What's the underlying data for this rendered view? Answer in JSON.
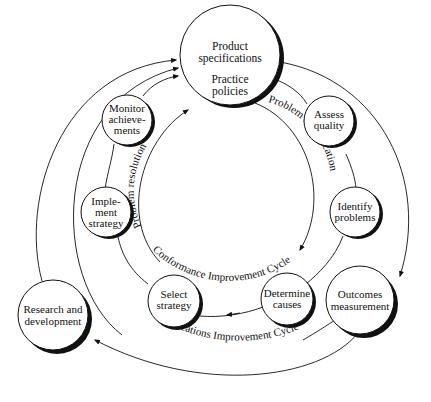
{
  "diagram": {
    "type": "cycle-diagram",
    "center_node": {
      "line1": "Product",
      "line2": "specifications",
      "line3": "Practice",
      "line4": "policies"
    },
    "nodes": {
      "monitor": {
        "line1": "Monitor",
        "line2": "achieve-",
        "line3": "ments"
      },
      "assess": {
        "line1": "Assess",
        "line2": "quality"
      },
      "implement": {
        "line1": "Imple-",
        "line2": "ment",
        "line3": "strategy"
      },
      "identify": {
        "line1": "Identify",
        "line2": "problems"
      },
      "select": {
        "line1": "Select",
        "line2": "strategy"
      },
      "determine": {
        "line1": "Determine",
        "line2": "causes"
      },
      "outcomes": {
        "line1": "Outcomes",
        "line2": "measurement"
      },
      "research": {
        "line1": "Research and",
        "line2": "development"
      }
    },
    "arc_labels": {
      "problem_resolution": "Problem resolution",
      "problem_identification": "Problem identification",
      "conformance_cycle": "Conformance Improvement Cycle",
      "specifications_cycle": "Specifications Improvement Cycle"
    },
    "colors": {
      "stroke": "#111111",
      "background": "#ffffff"
    }
  }
}
